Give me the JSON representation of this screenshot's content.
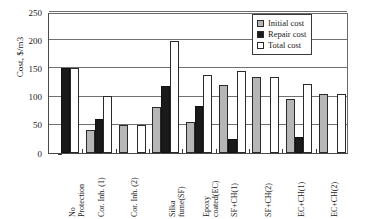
{
  "chart_data": {
    "type": "bar",
    "title": "",
    "xlabel": "",
    "ylabel": "Cost, $/m3",
    "ylim": [
      0,
      250
    ],
    "yticks": [
      0,
      50,
      100,
      150,
      200,
      250
    ],
    "ytick_labels": [
      "0",
      "50",
      "100",
      "150",
      "200",
      "250"
    ],
    "grid": true,
    "legend_position": "top-right",
    "categories": [
      "No\nProtection",
      "Cor. Inh. (1)",
      "Cor. Inh. (2)",
      "Silka\nfume(SF)",
      "Epoxy\ncoated(EC)",
      "SF+CH(1)",
      "SF+CH(2)",
      "EC+CH(1)",
      "EC+CH(2)"
    ],
    "series": [
      {
        "name": "Initial cost",
        "color": "#b6b6b6",
        "values": [
          0,
          40,
          50,
          81,
          55,
          121,
          134,
          96,
          105
        ]
      },
      {
        "name": "Repair cost",
        "color": "#1a1a1a",
        "values": [
          151,
          60,
          0,
          118,
          84,
          25,
          0,
          28,
          0
        ]
      },
      {
        "name": "Total cost",
        "color": "#ffffff",
        "values": [
          151,
          101,
          50,
          199,
          139,
          146,
          134,
          123,
          105
        ]
      }
    ]
  },
  "legend": {
    "items": [
      {
        "label": "Initial cost",
        "swatch": "initial"
      },
      {
        "label": "Repair cost",
        "swatch": "repair"
      },
      {
        "label": "Total cost",
        "swatch": "total"
      }
    ]
  }
}
